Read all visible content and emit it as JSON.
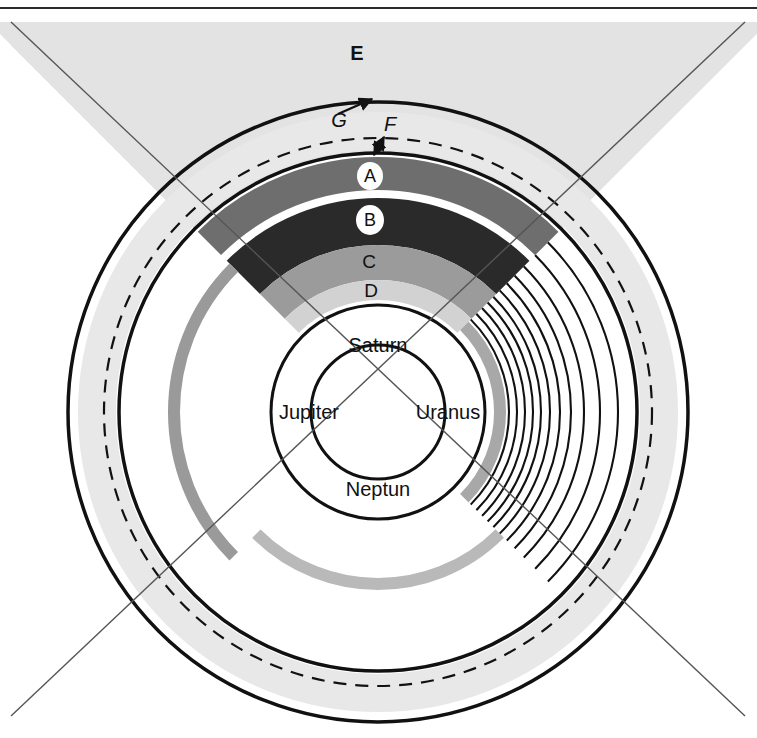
{
  "figure": {
    "top_rule": true,
    "background_color": "#ffffff",
    "line_color": "#111111",
    "quadrant_divider_color": "#555555"
  },
  "center": {
    "cx": 378,
    "cy": 412
  },
  "quadrants": [
    {
      "id": "saturn",
      "label": "Saturn",
      "position": "top",
      "x": 378,
      "y": 347
    },
    {
      "id": "jupiter",
      "label": "Jupiter",
      "position": "left",
      "x": 309,
      "y": 414
    },
    {
      "id": "uranus",
      "label": "Uranus",
      "position": "right",
      "x": 448,
      "y": 414
    },
    {
      "id": "neptune",
      "label": "Neptun",
      "position": "bottom",
      "x": 378,
      "y": 491
    }
  ],
  "ring_labels": [
    {
      "id": "A",
      "label": "A",
      "x": 370,
      "y": 176,
      "chip": true,
      "chip_rx": 13,
      "chip_ry": 14
    },
    {
      "id": "B",
      "label": "B",
      "x": 370,
      "y": 220,
      "chip": true,
      "chip_rx": 14,
      "chip_ry": 15
    },
    {
      "id": "C",
      "label": "C",
      "x": 369,
      "y": 262,
      "chip": false
    },
    {
      "id": "D",
      "label": "D",
      "x": 371,
      "y": 291,
      "chip": false
    },
    {
      "id": "E",
      "label": "E",
      "x": 357,
      "y": 55,
      "chip": false
    },
    {
      "id": "F",
      "label": "F",
      "x": 389,
      "y": 128,
      "chip": false
    },
    {
      "id": "G",
      "label": "G",
      "x": 339,
      "y": 119,
      "chip": false
    }
  ],
  "saturn_rings": [
    {
      "name": "A-ring",
      "color": "#6e6e6e",
      "r_inner": 222,
      "r_outer": 255
    },
    {
      "name": "B-ring",
      "color": "#2a2a2a",
      "r_inner": 167,
      "r_outer": 214
    },
    {
      "name": "C-ring",
      "color": "#9b9b9b",
      "r_inner": 132,
      "r_outer": 167
    },
    {
      "name": "D-ring",
      "color": "#d2d2d2",
      "r_inner": 112,
      "r_outer": 132
    }
  ],
  "circles": [
    {
      "name": "outer-solid-circle",
      "r": 310,
      "stroke": "#111111",
      "width": 3.5,
      "dash": "none"
    },
    {
      "name": "dashed-circle",
      "r": 274,
      "stroke": "#111111",
      "width": 2.2,
      "dash": "13 9"
    },
    {
      "name": "inner-solid-circle",
      "r": 259,
      "stroke": "#111111",
      "width": 3.5,
      "dash": "none"
    },
    {
      "name": "ring-base-circle",
      "r": 107,
      "stroke": "#111111",
      "width": 3.0,
      "dash": "none"
    },
    {
      "name": "planet-core-circle",
      "r": 67,
      "stroke": "#111111",
      "width": 3.0,
      "dash": "none"
    }
  ],
  "e_region": {
    "name": "E-sector-fill",
    "color": "#e3e3e3",
    "description": "light gray top sector bounded by the diagonal cross and the page top"
  },
  "outer_halo": {
    "name": "outer-gray-halo",
    "color": "#e8e8e8",
    "r_inner": 262,
    "r_outer": 300
  },
  "jupiter_ring": {
    "name": "jupiter-single-gray-ring",
    "color": "#9a9a9a",
    "r_inner": 198,
    "r_outer": 210
  },
  "neptune_rings": [
    {
      "name": "neptune-gray-arc",
      "color": "#b9b9b9",
      "r_inner": 166,
      "r_outer": 178
    }
  ],
  "uranus_rings": {
    "name": "uranus-thin-ring-set",
    "count": 11,
    "color": "#111111",
    "radii": [
      128,
      136,
      144,
      152,
      160,
      168,
      177,
      187,
      198,
      212,
      232
    ],
    "gray_band": {
      "color": "#a8a8a8",
      "r_inner": 116,
      "r_outer": 128
    }
  },
  "arrows": [
    {
      "name": "G-arrow",
      "from": "label-G",
      "to": "outer-solid-circle",
      "style": "single-head"
    },
    {
      "name": "F-arrow",
      "from": "dashed-circle",
      "to": "inner-solid-circle",
      "style": "double-head"
    }
  ],
  "diagonals": {
    "name": "quadrant-divider-cross",
    "stroke": "#555555",
    "width": 1.4,
    "lines": [
      {
        "x1": 11,
        "y1": 22,
        "x2": 745,
        "y2": 716
      },
      {
        "x1": 745,
        "y1": 22,
        "x2": 11,
        "y2": 716
      }
    ]
  }
}
